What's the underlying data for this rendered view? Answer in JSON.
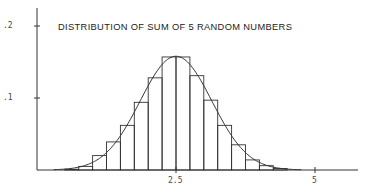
{
  "chart_data": {
    "type": "bar",
    "title": "DISTRIBUTION OF SUM OF 5 RANDOM NUMBERS",
    "xlabel": "",
    "ylabel": "",
    "x_ticks": [
      {
        "value": 2.5,
        "label": "2.5"
      },
      {
        "value": 5,
        "label": "5"
      }
    ],
    "y_ticks": [
      {
        "value": 0.1,
        "label": ".1"
      },
      {
        "value": 0.2,
        "label": ".2"
      }
    ],
    "xlim": [
      0,
      5.8
    ],
    "ylim": [
      0,
      0.2
    ],
    "grid": false,
    "legend": null,
    "bin_width": 0.25,
    "bins": [
      {
        "x0": 0.5,
        "x1": 0.75,
        "value": 0.001
      },
      {
        "x0": 0.75,
        "x1": 1.0,
        "value": 0.005
      },
      {
        "x0": 1.0,
        "x1": 1.25,
        "value": 0.02
      },
      {
        "x0": 1.25,
        "x1": 1.5,
        "value": 0.039
      },
      {
        "x0": 1.5,
        "x1": 1.75,
        "value": 0.062
      },
      {
        "x0": 1.75,
        "x1": 2.0,
        "value": 0.094
      },
      {
        "x0": 2.0,
        "x1": 2.25,
        "value": 0.128
      },
      {
        "x0": 2.25,
        "x1": 2.5,
        "value": 0.157
      },
      {
        "x0": 2.5,
        "x1": 2.75,
        "value": 0.157
      },
      {
        "x0": 2.75,
        "x1": 3.0,
        "value": 0.131
      },
      {
        "x0": 3.0,
        "x1": 3.25,
        "value": 0.097
      },
      {
        "x0": 3.25,
        "x1": 3.5,
        "value": 0.062
      },
      {
        "x0": 3.5,
        "x1": 3.75,
        "value": 0.035
      },
      {
        "x0": 3.75,
        "x1": 4.0,
        "value": 0.014
      },
      {
        "x0": 4.0,
        "x1": 4.25,
        "value": 0.006
      },
      {
        "x0": 4.25,
        "x1": 4.5,
        "value": 0.002
      }
    ],
    "overlay_curve": {
      "type": "line",
      "description": "Normal density approximation",
      "mean": 2.5,
      "peak": 0.158,
      "sd_in_bin_units": 0.645,
      "x_range": [
        0.3,
        4.75
      ]
    },
    "colors": {
      "line": "#333333",
      "background": "#ffffff"
    }
  }
}
